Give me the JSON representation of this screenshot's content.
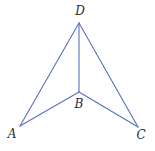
{
  "diagram": {
    "type": "geometry-figure",
    "colors": {
      "edge": "#5a6fbd",
      "label": "#2b2b2b",
      "background": "#ffffff"
    },
    "vertices": [
      {
        "id": "A",
        "label": "A",
        "x": 20,
        "y": 126,
        "label_x": 12,
        "label_y": 138
      },
      {
        "id": "B",
        "label": "B",
        "x": 79,
        "y": 92,
        "label_x": 79,
        "label_y": 108
      },
      {
        "id": "C",
        "label": "C",
        "x": 138,
        "y": 127,
        "label_x": 141,
        "label_y": 139
      },
      {
        "id": "D",
        "label": "D",
        "x": 79,
        "y": 23,
        "label_x": 80,
        "label_y": 15
      }
    ],
    "edges": [
      {
        "from": "A",
        "to": "D"
      },
      {
        "from": "D",
        "to": "C"
      },
      {
        "from": "D",
        "to": "B"
      },
      {
        "from": "A",
        "to": "B"
      },
      {
        "from": "B",
        "to": "C"
      }
    ]
  }
}
